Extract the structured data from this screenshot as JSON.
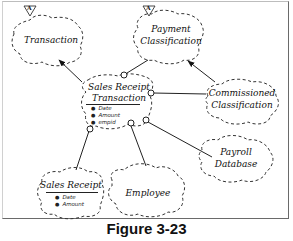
{
  "figure": {
    "caption": "Figure 3-23"
  },
  "classes": {
    "transaction": {
      "name": "Transaction",
      "abstract_marker": "A"
    },
    "payment_classification": {
      "line1": "Payment",
      "line2": "Classification",
      "abstract_marker": "A"
    },
    "sales_receipt_transaction": {
      "line1": "Sales Receipt",
      "line2": "Transaction",
      "attributes": [
        "Date",
        "Amount",
        "empid"
      ]
    },
    "commissioned_classification": {
      "line1": "Commissioned",
      "line2": "Classification"
    },
    "sales_receipt": {
      "name": "Sales Receipt",
      "attributes": [
        "Date",
        "Amount"
      ]
    },
    "employee": {
      "name": "Employee"
    },
    "payroll_database": {
      "line1": "Payroll",
      "line2": "Database"
    }
  },
  "relationships": [
    {
      "from": "Sales Receipt Transaction",
      "to": "Transaction",
      "type": "inheritance-arrow"
    },
    {
      "from": "Sales Receipt Transaction",
      "to": "Payment Classification",
      "type": "uses"
    },
    {
      "from": "Commissioned Classification",
      "to": "Payment Classification",
      "type": "inheritance-arrow"
    },
    {
      "from": "Sales Receipt Transaction",
      "to": "Commissioned Classification",
      "type": "uses"
    },
    {
      "from": "Sales Receipt Transaction",
      "to": "Sales Receipt",
      "type": "uses"
    },
    {
      "from": "Sales Receipt Transaction",
      "to": "Employee",
      "type": "uses"
    },
    {
      "from": "Sales Receipt Transaction",
      "to": "Payroll Database",
      "type": "uses"
    }
  ]
}
